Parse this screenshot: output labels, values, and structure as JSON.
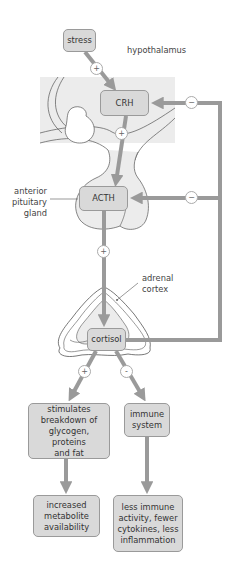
{
  "colors": {
    "arrow": "#9a9a9a",
    "box_fill": "#d9d9d9",
    "box_border": "#9a9a9a",
    "region_fill": "#ececec",
    "outline": "#555555"
  },
  "regions": {
    "hypothalamus": "hypothalamus",
    "anterior_pituitary": "anterior\npituitary\ngland",
    "adrenal_cortex": "adrenal\ncortex"
  },
  "nodes": {
    "stress": "stress",
    "crh": "CRH",
    "acth": "ACTH",
    "cortisol": "cortisol",
    "metabolic": "stimulates\nbreakdown of\nglycogen, proteins\nand fat",
    "immune": "immune\nsystem",
    "metabolite": "increased\nmetabolite\navailability",
    "less_immune": "less immune\nactivity, fewer\ncytokines, less\ninflammation"
  },
  "signs": {
    "stress_to_crh": "+",
    "crh_to_acth": "+",
    "acth_to_cortisol": "+",
    "cortisol_to_metabolic": "+",
    "cortisol_to_immune": "-",
    "feedback_crh": "−",
    "feedback_acth": "−"
  }
}
